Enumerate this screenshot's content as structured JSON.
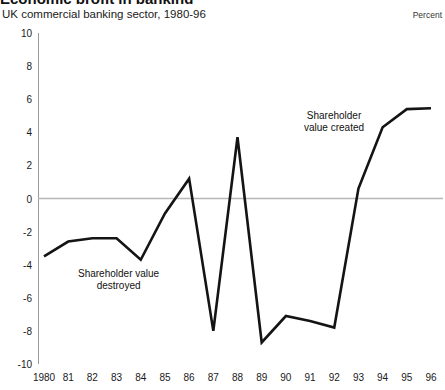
{
  "header": {
    "title": "Economic profit in banking",
    "subtitle": "UK commercial banking sector, 1980-96",
    "unit": "Percent"
  },
  "annotations": {
    "destroyed": {
      "line1": "Shareholder value",
      "line2": "destroyed"
    },
    "created": {
      "line1": "Shareholder",
      "line2": "value created"
    }
  },
  "style": {
    "line_color": "#141414",
    "zero_line_color": "#b7b7b7",
    "axis_color": "#9a9a9a",
    "background": "#ffffff"
  },
  "chart_data": {
    "type": "line",
    "title": "Economic profit in banking",
    "subtitle": "UK commercial banking sector, 1980-96",
    "xlabel": "",
    "ylabel": "Percent",
    "ylim": [
      -10,
      10
    ],
    "ytick_values": [
      10,
      8,
      6,
      4,
      2,
      0,
      -2,
      -4,
      -6,
      -8,
      -10
    ],
    "ytick_labels": [
      "10",
      "8",
      "6",
      "4",
      "2",
      "0",
      "-2",
      "-4",
      "-6",
      "-8",
      "-10"
    ],
    "grid": false,
    "zero_line": true,
    "legend": null,
    "categories": [
      "1980",
      "81",
      "82",
      "83",
      "84",
      "85",
      "86",
      "87",
      "88",
      "89",
      "90",
      "91",
      "92",
      "93",
      "94",
      "95",
      "96"
    ],
    "x": [
      1980,
      1981,
      1982,
      1983,
      1984,
      1985,
      1986,
      1987,
      1988,
      1989,
      1990,
      1991,
      1992,
      1993,
      1994,
      1995,
      1996
    ],
    "values": [
      -3.5,
      -2.6,
      -2.4,
      -2.4,
      -3.7,
      -0.9,
      1.2,
      -8.0,
      3.7,
      -8.7,
      -7.1,
      -7.4,
      -7.8,
      0.6,
      4.3,
      5.4,
      5.45
    ],
    "series": [
      {
        "name": "Economic profit",
        "values": [
          -3.5,
          -2.6,
          -2.4,
          -2.4,
          -3.7,
          -0.9,
          1.2,
          -8.0,
          3.7,
          -8.7,
          -7.1,
          -7.4,
          -7.8,
          0.6,
          4.3,
          5.4,
          5.45
        ]
      }
    ]
  }
}
